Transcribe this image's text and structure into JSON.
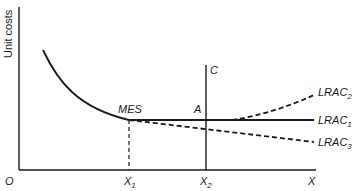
{
  "diagram": {
    "type": "economics-cost-curve",
    "y_axis_label": "Unit costs",
    "origin_label": "O",
    "x_axis_label": "X",
    "tick_labels": [
      {
        "base": "X",
        "sub": "1"
      },
      {
        "base": "X",
        "sub": "2"
      }
    ],
    "points": {
      "mes": "MES",
      "a": "A"
    },
    "vertical_line_label": "C",
    "curves": [
      {
        "base": "LRAC",
        "sub": "2",
        "style": "dashed",
        "trend": "rising after A"
      },
      {
        "base": "LRAC",
        "sub": "1",
        "style": "solid",
        "trend": "flat after MES"
      },
      {
        "base": "LRAC",
        "sub": "3",
        "style": "dashed",
        "trend": "falling after MES"
      }
    ],
    "colors": {
      "line": "#1a1a1a",
      "background": "#ffffff"
    }
  }
}
